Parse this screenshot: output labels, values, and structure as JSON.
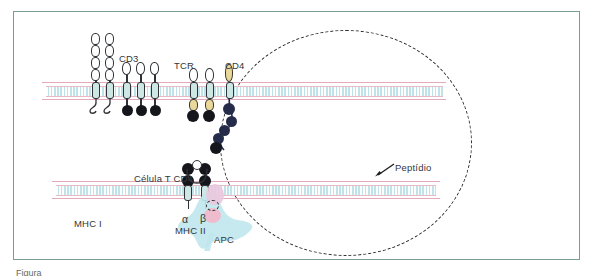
{
  "figure": {
    "domain": "immunology-diagram",
    "frame_color": "#7a9e8e",
    "background": "#ffffff",
    "caption_partial": "Figura"
  },
  "inset": {
    "name": "magnified-synapse-inset",
    "boundary_style": "dashed-circle",
    "boundary_color": "#2b2b2b"
  },
  "membranes": {
    "fill_color": "#d6eef1",
    "edge_color": "#e9b9c6",
    "t_cell_membrane_label": "",
    "apc_membrane_label": ""
  },
  "labels": {
    "cd3": "CD3",
    "tcr": "TCR",
    "cd4_receptor": "CD4",
    "peptide": "Peptídio",
    "alpha": "α",
    "beta": "β",
    "mhc_ii": "MHC II",
    "mhc_i": "MHC I",
    "t_cell": "Célula T CD4",
    "apc": "APC"
  },
  "colors": {
    "membrane_band": "#d6eef1",
    "membrane_edge": "#e9b9c6",
    "apc_cytoplasm": "#bfe7ec",
    "apc_nucleus": "#f0b9c9",
    "t_cell_body": "#e9c8dd",
    "domain_outline": "#2f3237",
    "tm_domain": "#cfe7e4",
    "dark_domain": "#14161c",
    "tcr_gold": "#e8d89a",
    "cd4_bead": "#242c4a"
  },
  "structures": {
    "cd3_tall_chains": 2,
    "cd3_short_chains": 3,
    "tcr_chains": 2,
    "cd4_chains": 1,
    "cd4_bead_count": 5,
    "mhc_ii_chains": 2
  }
}
